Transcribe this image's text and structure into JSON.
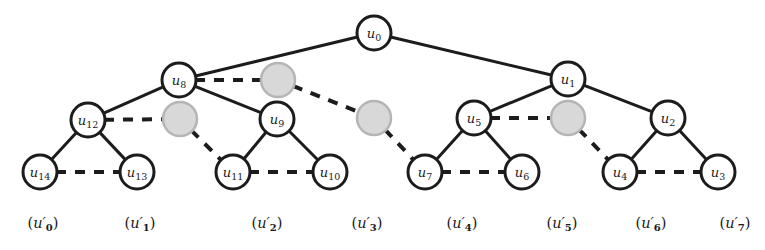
{
  "diagram": {
    "colors": {
      "background": "#ffffff",
      "edge_solid": "#1c1c1c",
      "edge_dashed": "#1c1c1c",
      "node_fill": "#ffffff",
      "node_stroke": "#1c1c1c",
      "ghost_fill": "#d8d8d8",
      "ghost_stroke": "#b5b5b5",
      "text": "#1a1a1a"
    },
    "geometry": {
      "width": 765,
      "height": 250,
      "node_radius": 17,
      "ghost_radius": 17,
      "solid_stroke_width": 3,
      "dashed_stroke_width": 4,
      "dash_pattern": "10,9"
    },
    "nodes": [
      {
        "id": "u0",
        "base": "u",
        "sub": "0",
        "x": 374,
        "y": 33,
        "kind": "labelled"
      },
      {
        "id": "u8",
        "base": "u",
        "sub": "8",
        "x": 179,
        "y": 80,
        "kind": "labelled"
      },
      {
        "id": "g1",
        "base": "",
        "sub": "",
        "x": 278,
        "y": 80,
        "kind": "ghost"
      },
      {
        "id": "u1",
        "base": "u",
        "sub": "1",
        "x": 568,
        "y": 79,
        "kind": "labelled"
      },
      {
        "id": "u12",
        "base": "u",
        "sub": "12",
        "x": 88,
        "y": 120,
        "kind": "labelled"
      },
      {
        "id": "g2",
        "base": "",
        "sub": "",
        "x": 180,
        "y": 119,
        "kind": "ghost"
      },
      {
        "id": "u9",
        "base": "u",
        "sub": "9",
        "x": 277,
        "y": 119,
        "kind": "labelled"
      },
      {
        "id": "g3",
        "base": "",
        "sub": "",
        "x": 374,
        "y": 118,
        "kind": "ghost"
      },
      {
        "id": "u5",
        "base": "u",
        "sub": "5",
        "x": 474,
        "y": 118,
        "kind": "labelled"
      },
      {
        "id": "g4",
        "base": "",
        "sub": "",
        "x": 568,
        "y": 118,
        "kind": "ghost"
      },
      {
        "id": "u2",
        "base": "u",
        "sub": "2",
        "x": 668,
        "y": 118,
        "kind": "labelled"
      },
      {
        "id": "u14",
        "base": "u",
        "sub": "14",
        "x": 40,
        "y": 172,
        "kind": "labelled"
      },
      {
        "id": "u13",
        "base": "u",
        "sub": "13",
        "x": 137,
        "y": 172,
        "kind": "labelled"
      },
      {
        "id": "u11",
        "base": "u",
        "sub": "11",
        "x": 233,
        "y": 172,
        "kind": "labelled"
      },
      {
        "id": "u10",
        "base": "u",
        "sub": "10",
        "x": 330,
        "y": 172,
        "kind": "labelled"
      },
      {
        "id": "u7",
        "base": "u",
        "sub": "7",
        "x": 425,
        "y": 172,
        "kind": "labelled"
      },
      {
        "id": "u6",
        "base": "u",
        "sub": "6",
        "x": 522,
        "y": 172,
        "kind": "labelled"
      },
      {
        "id": "u4",
        "base": "u",
        "sub": "4",
        "x": 620,
        "y": 172,
        "kind": "labelled"
      },
      {
        "id": "u3",
        "base": "u",
        "sub": "3",
        "x": 718,
        "y": 172,
        "kind": "labelled"
      }
    ],
    "edges": [
      {
        "from": "u0",
        "to": "u8",
        "style": "solid"
      },
      {
        "from": "u0",
        "to": "u1",
        "style": "solid"
      },
      {
        "from": "u8",
        "to": "u12",
        "style": "solid"
      },
      {
        "from": "u8",
        "to": "u9",
        "style": "solid"
      },
      {
        "from": "u8",
        "to": "g1",
        "style": "dashed"
      },
      {
        "from": "g1",
        "to": "g3",
        "style": "dashed"
      },
      {
        "from": "u1",
        "to": "u5",
        "style": "solid"
      },
      {
        "from": "u1",
        "to": "u2",
        "style": "solid"
      },
      {
        "from": "u12",
        "to": "u14",
        "style": "solid"
      },
      {
        "from": "u12",
        "to": "u13",
        "style": "solid"
      },
      {
        "from": "u12",
        "to": "g2",
        "style": "dashed"
      },
      {
        "from": "g2",
        "to": "u11",
        "style": "dashed"
      },
      {
        "from": "u9",
        "to": "u11",
        "style": "solid"
      },
      {
        "from": "u9",
        "to": "u10",
        "style": "solid"
      },
      {
        "from": "g3",
        "to": "u7",
        "style": "dashed"
      },
      {
        "from": "u5",
        "to": "u7",
        "style": "solid"
      },
      {
        "from": "u5",
        "to": "u6",
        "style": "solid"
      },
      {
        "from": "u5",
        "to": "g4",
        "style": "dashed"
      },
      {
        "from": "g4",
        "to": "u4",
        "style": "dashed"
      },
      {
        "from": "u2",
        "to": "u4",
        "style": "solid"
      },
      {
        "from": "u2",
        "to": "u3",
        "style": "solid"
      },
      {
        "from": "u14",
        "to": "u13",
        "style": "dashed"
      },
      {
        "from": "u11",
        "to": "u10",
        "style": "dashed"
      },
      {
        "from": "u7",
        "to": "u6",
        "style": "dashed"
      },
      {
        "from": "u4",
        "to": "u3",
        "style": "dashed"
      }
    ],
    "leaf_captions": [
      {
        "id": "cap0",
        "base": "u",
        "sub": "0",
        "x": 43,
        "y": 224
      },
      {
        "id": "cap1",
        "base": "u",
        "sub": "1",
        "x": 140,
        "y": 224
      },
      {
        "id": "cap2",
        "base": "u",
        "sub": "2",
        "x": 267,
        "y": 224
      },
      {
        "id": "cap3",
        "base": "u",
        "sub": "3",
        "x": 367,
        "y": 224
      },
      {
        "id": "cap4",
        "base": "u",
        "sub": "4",
        "x": 462,
        "y": 224
      },
      {
        "id": "cap5",
        "base": "u",
        "sub": "5",
        "x": 562,
        "y": 224
      },
      {
        "id": "cap6",
        "base": "u",
        "sub": "6",
        "x": 651,
        "y": 224
      },
      {
        "id": "cap7",
        "base": "u",
        "sub": "7",
        "x": 735,
        "y": 224
      }
    ]
  }
}
